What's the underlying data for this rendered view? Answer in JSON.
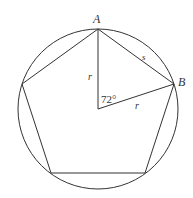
{
  "diagram": {
    "labels": {
      "vertex_a": "A",
      "vertex_b": "B",
      "radius_vertical": "r",
      "radius_diagonal": "r",
      "side": "s",
      "central_angle": "72°"
    },
    "colors": {
      "stroke": "#333333",
      "background": "#ffffff"
    }
  }
}
